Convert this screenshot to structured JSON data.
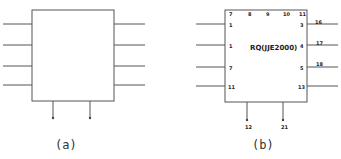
{
  "diagram_a": {
    "caption": "(a)",
    "left_pins": 4,
    "right_pins": 4,
    "bottom_pins": 2
  },
  "diagram_b": {
    "caption": "(b)",
    "chip_label": "RQ(JJE2000)",
    "top_pin_labels": [
      "7",
      "8",
      "9",
      "10",
      "11"
    ],
    "left_pin_labels": [
      "1",
      "1",
      "7",
      "11"
    ],
    "right_inner_labels": [
      "3",
      "4",
      "5",
      "13"
    ],
    "right_outer_labels": [
      "16",
      "17",
      "18"
    ],
    "bottom_pin_labels": [
      "12",
      "21"
    ]
  },
  "colors": {
    "stroke": "#444444",
    "text": "#222222"
  }
}
